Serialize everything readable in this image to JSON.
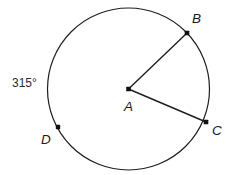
{
  "figure": {
    "background_color": "#ffffff",
    "stroke_color": "#1f1f1f",
    "label_color": "#1a1a1a",
    "stroke_width": 1.2
  },
  "circle": {
    "center_label": "A",
    "center_x": 128.5,
    "center_y": 89,
    "radius": 81
  },
  "points": [
    {
      "name": "point-a",
      "label": "A",
      "x": 128.5,
      "y": 89,
      "label_x": 124,
      "label_y": 111,
      "is_center": true
    },
    {
      "name": "point-b",
      "label": "B",
      "x": 187,
      "y": 33,
      "label_x": 192,
      "label_y": 23,
      "is_center": false
    },
    {
      "name": "point-c",
      "label": "C",
      "x": 206,
      "y": 122,
      "label_x": 212,
      "label_y": 135,
      "is_center": false
    },
    {
      "name": "point-d",
      "label": "D",
      "x": 58,
      "y": 127,
      "label_x": 41,
      "label_y": 144,
      "is_center": false
    }
  ],
  "radii": [
    {
      "name": "radius-ab",
      "from": "A",
      "to": "B"
    },
    {
      "name": "radius-ac",
      "from": "A",
      "to": "C"
    }
  ],
  "annotations": {
    "arc_measure": {
      "label": "315°",
      "value": 315,
      "unit": "degrees",
      "x": 12,
      "y": 87
    }
  },
  "chart_data": {
    "type": "diagram",
    "shape": "circle",
    "center": {
      "label": "A",
      "x": 128.5,
      "y": 89
    },
    "radius": 81,
    "marked_points": [
      {
        "label": "B",
        "angle_deg": 43.7
      },
      {
        "label": "C",
        "angle_deg": -22.0
      },
      {
        "label": "D",
        "angle_deg": 208.0
      }
    ],
    "drawn_segments": [
      [
        "A",
        "B"
      ],
      [
        "A",
        "C"
      ]
    ],
    "labels": [
      "315°",
      "A",
      "B",
      "C",
      "D"
    ],
    "annotation_values": [
      315
    ]
  }
}
